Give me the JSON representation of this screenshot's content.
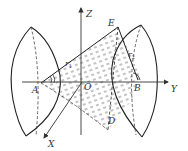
{
  "diagram": {
    "type": "3D geometry figure: two spherical caps with cone between",
    "colors": {
      "stroke": "#222222",
      "axis": "#333333",
      "hatch": "#555555",
      "background": "#ffffff"
    },
    "axes": {
      "z": {
        "label": "Z"
      },
      "y": {
        "label": "Y"
      },
      "x": {
        "label": "X"
      }
    },
    "points": {
      "A": "A",
      "B": "B",
      "E": "E",
      "D": "D",
      "O": "O"
    },
    "radii": {
      "r1": "r",
      "r1_sub": "1",
      "r2": "r",
      "r2_sub": "2"
    }
  }
}
